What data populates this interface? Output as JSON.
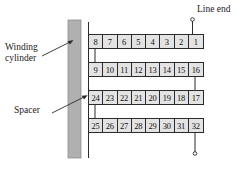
{
  "figure": {
    "background_color": "#ffffff"
  },
  "labels": {
    "winding_cylinder": "Winding\ncylinder",
    "winding_cylinder_line1": "Winding",
    "winding_cylinder_line2": "cylinder",
    "spacer": "Spacer",
    "line_end": "Line end"
  },
  "colors": {
    "cylinder_fill": "#b0b0b0",
    "cell_fill": "#e3e3e3",
    "stroke": "#2b2b2b",
    "text": "#111111"
  },
  "cylinder": {
    "name": "winding-cylinder",
    "x": 68,
    "y": 20,
    "width": 13,
    "height": 138
  },
  "spacer_line": {
    "name": "spacer-line",
    "x": 88,
    "y_top": 22,
    "y_bottom": 158
  },
  "layers": [
    {
      "name": "layer-row-1",
      "index": 1,
      "cells": [
        "8",
        "7",
        "6",
        "5",
        "4",
        "3",
        "2",
        "1"
      ]
    },
    {
      "name": "layer-row-2",
      "index": 2,
      "cells": [
        "9",
        "10",
        "11",
        "12",
        "13",
        "14",
        "15",
        "16"
      ]
    },
    {
      "name": "layer-row-3",
      "index": 3,
      "cells": [
        "24",
        "23",
        "22",
        "21",
        "20",
        "19",
        "18",
        "17"
      ]
    },
    {
      "name": "layer-row-4",
      "index": 4,
      "cells": [
        "25",
        "26",
        "27",
        "28",
        "29",
        "30",
        "31",
        "32"
      ]
    }
  ],
  "connectors": [
    {
      "name": "connector-row1-row2-left",
      "side": "left"
    },
    {
      "name": "connector-row2-row3-right",
      "side": "right"
    },
    {
      "name": "connector-row3-row4-left",
      "side": "left"
    }
  ],
  "terminals": [
    {
      "name": "line-end-terminal-top",
      "position": "top",
      "marker": "circle"
    },
    {
      "name": "line-end-terminal-bottom",
      "position": "bottom",
      "marker": "circle"
    }
  ],
  "leader_lines": [
    {
      "name": "leader-winding-cylinder",
      "arrow": true
    },
    {
      "name": "leader-spacer",
      "arrow": true
    }
  ]
}
